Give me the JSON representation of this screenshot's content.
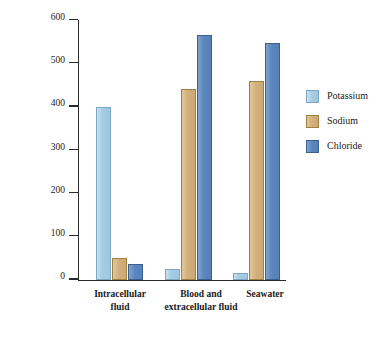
{
  "chart_data": {
    "type": "bar",
    "title": "",
    "xlabel": "",
    "ylabel": "Concentration (milliMoles)",
    "ylim": [
      0,
      600
    ],
    "yticks": [
      0,
      100,
      200,
      300,
      400,
      500,
      600
    ],
    "ytick_labels": [
      "0",
      "100",
      "200",
      "300",
      "400",
      "500",
      "600"
    ],
    "grid": false,
    "legend_position": "right",
    "categories": [
      "Intracellular fluid",
      "Blood and extracellular fluid",
      "Seawater"
    ],
    "category_lines": [
      [
        "Intracellular",
        "fluid"
      ],
      [
        "Blood and",
        "extracellular fluid"
      ],
      [
        "Seawater"
      ]
    ],
    "series": [
      {
        "name": "Potassium",
        "color": "#a6cce4",
        "values": [
          400,
          25,
          15
        ]
      },
      {
        "name": "Sodium",
        "color": "#d2b07c",
        "values": [
          50,
          440,
          460
        ]
      },
      {
        "name": "Chloride",
        "color": "#5b86bd",
        "values": [
          35,
          565,
          547
        ]
      }
    ]
  },
  "legend": {
    "items": [
      {
        "label": "Potassium",
        "color": "#a6cce4"
      },
      {
        "label": "Sodium",
        "color": "#d2b07c"
      },
      {
        "label": "Chloride",
        "color": "#5b86bd"
      }
    ]
  }
}
